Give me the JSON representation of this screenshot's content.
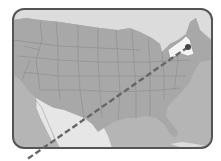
{
  "map": {
    "description": "Grayscale map of the contiguous United States with New York highlighted and a dashed route line extending southwest out of the frame",
    "highlighted_region": "New York",
    "marker": "point in New York",
    "route_style": "dashed",
    "colors": {
      "frame_border": "#555555",
      "us_land": "#a9a9a9",
      "state_lines": "#8a8a8a",
      "canada": "#d6d6d6",
      "mexico": "#e6e6e6",
      "water": "#b8b8b8",
      "highlight": "#f2f2f2",
      "route": "#666666",
      "marker": "#444444",
      "background": "#ffffff"
    }
  }
}
